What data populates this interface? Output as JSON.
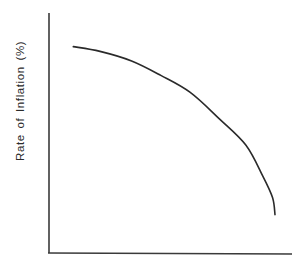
{
  "chart_data": {
    "type": "line",
    "title": "",
    "xlabel": "",
    "ylabel": "Rate of Inflation (%)",
    "grid": false,
    "legend": null,
    "axis_color": "#3a3a3a",
    "line_color": "#2a2a2a",
    "x_ticks": [],
    "y_ticks": [],
    "xlim": [
      0,
      100
    ],
    "ylim": [
      0,
      100
    ],
    "series": [
      {
        "name": "curve",
        "description": "concave, downward-sloping curve (no numeric scale shown)",
        "x": [
          10,
          21,
          34,
          46,
          58,
          70,
          81,
          88,
          92,
          93
        ],
        "y": [
          86,
          84,
          80,
          74,
          67,
          56,
          45,
          32,
          23,
          16
        ]
      }
    ]
  }
}
